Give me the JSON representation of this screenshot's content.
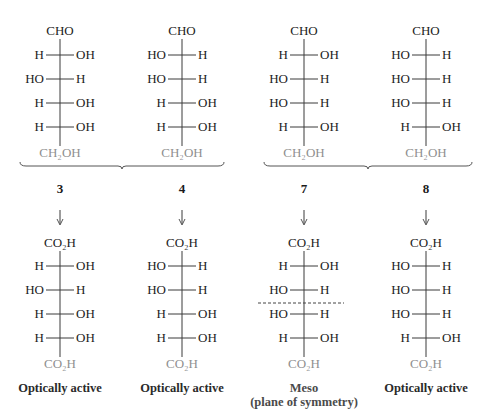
{
  "figure": {
    "colors": {
      "text": "#1c1c1c",
      "terminal_group": "#8f8f8f",
      "lines": "#3a3a3a"
    },
    "groups": [
      {
        "members": [
          "3",
          "4"
        ]
      },
      {
        "members": [
          "7",
          "8"
        ]
      }
    ],
    "structures": [
      {
        "id": "3",
        "top_group": "CHO",
        "rows": [
          {
            "left": "H",
            "right": "OH"
          },
          {
            "left": "HO",
            "right": "H"
          },
          {
            "left": "H",
            "right": "OH"
          },
          {
            "left": "H",
            "right": "OH"
          }
        ],
        "bottom_group": "CH₂OH",
        "product": {
          "top_group": "CO₂H",
          "rows": [
            {
              "left": "H",
              "right": "OH"
            },
            {
              "left": "HO",
              "right": "H"
            },
            {
              "left": "H",
              "right": "OH"
            },
            {
              "left": "H",
              "right": "OH"
            }
          ],
          "bottom_group": "CO₂H",
          "label": "Optically active",
          "sublabel": ""
        }
      },
      {
        "id": "4",
        "top_group": "CHO",
        "rows": [
          {
            "left": "HO",
            "right": "H"
          },
          {
            "left": "HO",
            "right": "H"
          },
          {
            "left": "H",
            "right": "OH"
          },
          {
            "left": "H",
            "right": "OH"
          }
        ],
        "bottom_group": "CH₂OH",
        "product": {
          "top_group": "CO₂H",
          "rows": [
            {
              "left": "HO",
              "right": "H"
            },
            {
              "left": "HO",
              "right": "H"
            },
            {
              "left": "H",
              "right": "OH"
            },
            {
              "left": "H",
              "right": "OH"
            }
          ],
          "bottom_group": "CO₂H",
          "label": "Optically active",
          "sublabel": ""
        }
      },
      {
        "id": "7",
        "top_group": "CHO",
        "rows": [
          {
            "left": "H",
            "right": "OH"
          },
          {
            "left": "HO",
            "right": "H"
          },
          {
            "left": "HO",
            "right": "H"
          },
          {
            "left": "H",
            "right": "OH"
          }
        ],
        "bottom_group": "CH₂OH",
        "product": {
          "top_group": "CO₂H",
          "rows": [
            {
              "left": "H",
              "right": "OH"
            },
            {
              "left": "HO",
              "right": "H"
            },
            {
              "left": "HO",
              "right": "H"
            },
            {
              "left": "H",
              "right": "OH"
            }
          ],
          "bottom_group": "CO₂H",
          "label": "Meso",
          "sublabel": "(plane of symmetry)",
          "symmetry_plane": true
        }
      },
      {
        "id": "8",
        "top_group": "CHO",
        "rows": [
          {
            "left": "HO",
            "right": "H"
          },
          {
            "left": "HO",
            "right": "H"
          },
          {
            "left": "HO",
            "right": "H"
          },
          {
            "left": "H",
            "right": "OH"
          }
        ],
        "bottom_group": "CH₂OH",
        "product": {
          "top_group": "CO₂H",
          "rows": [
            {
              "left": "HO",
              "right": "H"
            },
            {
              "left": "HO",
              "right": "H"
            },
            {
              "left": "HO",
              "right": "H"
            },
            {
              "left": "H",
              "right": "OH"
            }
          ],
          "bottom_group": "CO₂H",
          "label": "Optically active",
          "sublabel": ""
        }
      }
    ]
  }
}
